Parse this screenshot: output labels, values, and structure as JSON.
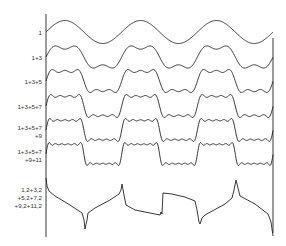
{
  "diagram": {
    "colors": {
      "line": "#222222",
      "text": "#333333",
      "background": "#ffffff"
    },
    "axes": {
      "left_x": 46,
      "right_x": 273,
      "top_y": 14,
      "bottom_y": 237
    },
    "period_px": 75.7,
    "rows": [
      {
        "label": "1",
        "label_y": 29,
        "center_y": 32,
        "amp": 11.5,
        "harmonics": [
          1
        ]
      },
      {
        "label": "1+3",
        "label_y": 54,
        "center_y": 57,
        "amp": 13,
        "harmonics": [
          1,
          3
        ]
      },
      {
        "label": "1+3+5",
        "label_y": 78,
        "center_y": 81,
        "amp": 13.5,
        "harmonics": [
          1,
          3,
          5
        ]
      },
      {
        "label": "1+3+5+7",
        "label_y": 103,
        "center_y": 106,
        "amp": 13.5,
        "harmonics": [
          1,
          3,
          5,
          7
        ]
      },
      {
        "label": "1+3+5+7\n+9",
        "label_y": 124,
        "center_y": 130,
        "amp": 13.5,
        "harmonics": [
          1,
          3,
          5,
          7,
          9
        ]
      },
      {
        "label": "1+3+5+7\n+9+11",
        "label_y": 148,
        "center_y": 154,
        "amp": 13.5,
        "harmonics": [
          1,
          3,
          5,
          7,
          9,
          11
        ]
      }
    ],
    "distorted": {
      "label": "1,2+3,2\n+5,2+7,2\n+9,2+11,2",
      "label_y": 186,
      "points": [
        [
          46,
          178
        ],
        [
          47,
          186
        ],
        [
          49,
          191
        ],
        [
          55,
          196
        ],
        [
          70,
          205
        ],
        [
          82,
          213
        ],
        [
          84,
          220
        ],
        [
          85,
          229
        ],
        [
          87,
          220
        ],
        [
          88,
          213
        ],
        [
          95,
          208
        ],
        [
          110,
          200
        ],
        [
          119,
          194
        ],
        [
          121,
          190
        ],
        [
          122,
          184
        ],
        [
          124,
          195
        ],
        [
          126,
          205
        ],
        [
          135,
          210
        ],
        [
          150,
          213
        ],
        [
          160,
          215
        ],
        [
          161,
          212
        ],
        [
          162,
          214
        ],
        [
          163,
          193
        ],
        [
          172,
          194
        ],
        [
          185,
          197
        ],
        [
          195,
          201
        ],
        [
          197,
          210
        ],
        [
          199,
          222
        ],
        [
          200,
          224
        ],
        [
          202,
          218
        ],
        [
          205,
          215
        ],
        [
          225,
          204
        ],
        [
          232,
          198
        ],
        [
          234,
          190
        ],
        [
          236,
          180
        ],
        [
          238,
          188
        ],
        [
          240,
          196
        ],
        [
          255,
          204
        ],
        [
          268,
          214
        ],
        [
          271,
          222
        ],
        [
          273,
          236
        ]
      ]
    }
  }
}
